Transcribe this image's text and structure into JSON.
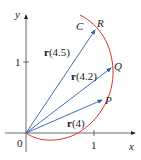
{
  "axes": {
    "x_label": "x",
    "y_label": "y",
    "origin_label": "0",
    "x_tick": "1",
    "y_tick": "1"
  },
  "curve": {
    "label": "C",
    "color": "#d9302a"
  },
  "vectors": {
    "color": "#2a5fa8",
    "items": [
      {
        "label_bold": "r",
        "label_arg": "(4.5)",
        "point": "R"
      },
      {
        "label_bold": "r",
        "label_arg": "(4.2)",
        "point": "Q"
      },
      {
        "label_bold": "r",
        "label_arg": "(4)",
        "point": "P"
      }
    ]
  }
}
